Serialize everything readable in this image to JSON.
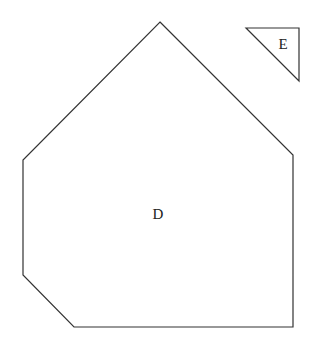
{
  "shapes": [
    {
      "label": "D",
      "type": "polygon",
      "points": [
        [
          160,
          22
        ],
        [
          293,
          155
        ],
        [
          293,
          327
        ],
        [
          74,
          327
        ],
        [
          23,
          275
        ],
        [
          23,
          160
        ]
      ],
      "label_position": [
        158,
        219
      ]
    },
    {
      "label": "E",
      "type": "triangle",
      "points": [
        [
          246,
          28
        ],
        [
          299,
          28
        ],
        [
          299,
          81
        ]
      ],
      "label_position": [
        283,
        49
      ]
    }
  ],
  "style": {
    "stroke": "#333333",
    "fill": "#ffffff"
  }
}
